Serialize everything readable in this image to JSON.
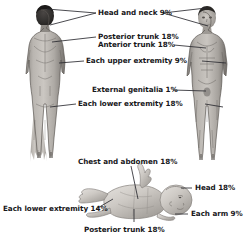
{
  "diagram": {
    "figures": [
      {
        "name": "adult-posterior-figure",
        "view": "posterior",
        "subject": "adult male"
      },
      {
        "name": "adult-anterior-figure",
        "view": "anterior",
        "subject": "adult male"
      },
      {
        "name": "infant-figure",
        "view": "supine",
        "subject": "infant"
      }
    ],
    "colors": {
      "line": "#2b2b30",
      "text": "#17171a",
      "background": "#ffffff",
      "skin_light": "#d9d6d1",
      "skin_mid": "#a9a5a0",
      "skin_dark": "#6e6a67",
      "hair": "#2e2b29"
    },
    "labels": [
      {
        "id": "head-and-neck",
        "text": "Head and neck 9%",
        "region": "head and neck",
        "value": 9,
        "group": "adult"
      },
      {
        "id": "posterior-trunk",
        "text": "Posterior trunk 18%",
        "region": "posterior trunk",
        "value": 18,
        "group": "adult"
      },
      {
        "id": "anterior-trunk",
        "text": "Anterior trunk 18%",
        "region": "anterior trunk",
        "value": 18,
        "group": "adult"
      },
      {
        "id": "each-upper-extremity",
        "text": "Each upper extremity 9%",
        "region": "each upper extremity",
        "value": 9,
        "group": "adult"
      },
      {
        "id": "external-genitalia",
        "text": "External genitalia 1%",
        "region": "external genitalia",
        "value": 1,
        "group": "adult"
      },
      {
        "id": "each-lower-extremity-adult",
        "text": "Each lower extremity 18%",
        "region": "each lower extremity",
        "value": 18,
        "group": "adult"
      },
      {
        "id": "chest-and-abdomen",
        "text": "Chest and abdomen 18%",
        "region": "chest and abdomen",
        "value": 18,
        "group": "infant"
      },
      {
        "id": "infant-head",
        "text": "Head 18%",
        "region": "head",
        "value": 18,
        "group": "infant"
      },
      {
        "id": "each-arm",
        "text": "Each arm 9%",
        "region": "each arm",
        "value": 9,
        "group": "infant"
      },
      {
        "id": "each-lower-extremity-infant",
        "text": "Each lower extremity 14%",
        "region": "each lower extremity",
        "value": 14,
        "group": "infant"
      },
      {
        "id": "infant-posterior-trunk",
        "text": "Posterior trunk 18%",
        "region": "posterior trunk",
        "value": 18,
        "group": "infant"
      }
    ]
  }
}
